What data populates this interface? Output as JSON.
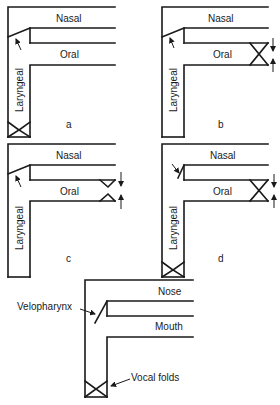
{
  "panels": [
    {
      "id": "a",
      "caption": "a",
      "top_label": "Nasal",
      "mid_label": "Oral",
      "vertical_label": "Laryngeal",
      "velum": "open",
      "oral_constriction": "none",
      "glottis": "closed"
    },
    {
      "id": "b",
      "caption": "b",
      "top_label": "Nasal",
      "mid_label": "Oral",
      "vertical_label": "Laryngeal",
      "velum": "open",
      "oral_constriction": "complete",
      "glottis": "open"
    },
    {
      "id": "c",
      "caption": "c",
      "top_label": "Nasal",
      "mid_label": "Oral",
      "vertical_label": "Laryngeal",
      "velum": "open",
      "oral_constriction": "partial",
      "glottis": "open"
    },
    {
      "id": "d",
      "caption": "d",
      "top_label": "Nasal",
      "mid_label": "Oral",
      "vertical_label": "Laryngeal",
      "velum": "closed",
      "oral_constriction": "complete",
      "glottis": "closed"
    }
  ],
  "key_panel": {
    "top_label": "Nose",
    "mid_label": "Mouth",
    "callouts": {
      "velopharynx": "Velopharynx",
      "vocal_folds": "Vocal folds"
    }
  },
  "colors": {
    "line": "#1a1a1a",
    "background": "#ffffff"
  }
}
